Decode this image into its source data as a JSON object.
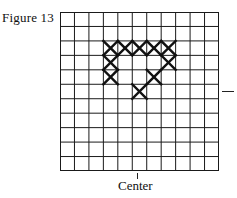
{
  "figure": {
    "label": "Figure 13",
    "center_label": "Center",
    "grid": {
      "rows": 11,
      "cols": 11,
      "line_color": "#1a1a1a",
      "mark_color": "#111111",
      "marks": [
        {
          "row": 2,
          "col": 3
        },
        {
          "row": 2,
          "col": 4
        },
        {
          "row": 2,
          "col": 5
        },
        {
          "row": 2,
          "col": 6
        },
        {
          "row": 2,
          "col": 7
        },
        {
          "row": 3,
          "col": 3
        },
        {
          "row": 3,
          "col": 7
        },
        {
          "row": 4,
          "col": 3
        },
        {
          "row": 4,
          "col": 6
        },
        {
          "row": 5,
          "col": 5
        }
      ],
      "center_col": 5,
      "side_marker_row": 5
    }
  }
}
